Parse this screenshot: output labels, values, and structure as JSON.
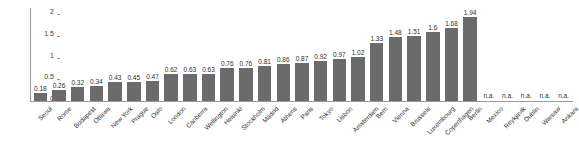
{
  "chart_data": {
    "type": "bar",
    "title": "",
    "subtitle": "",
    "xlabel": "",
    "ylabel": "",
    "ylim": [
      0,
      2.15
    ],
    "yticks": [
      "0",
      "0.5",
      "1",
      "1.5",
      "2"
    ],
    "ytick_values": [
      0,
      0.5,
      1,
      1.5,
      2
    ],
    "grid": false,
    "legend": false,
    "legend_position": "none",
    "bar_color": "#6b6b6b",
    "axis_color": "#9a9a9a",
    "text_color": "#2e2e2e",
    "background": "#ffffff",
    "na_label": "n.a.",
    "categories": [
      "Seoul",
      "Rome",
      "Budapest",
      "Ottawa",
      "New York",
      "Prague",
      "Oslo",
      "London",
      "Canberra",
      "Wellington",
      "Helsinki",
      "Stockholm",
      "Madrid",
      "Athens",
      "Paris",
      "Tokyo",
      "Lisbon",
      "Amsterdam",
      "Bern",
      "Vienna",
      "Brussels",
      "Luxembourg",
      "Copenhagen",
      "Berlin",
      "Mexico",
      "Reykjavik",
      "Dublin",
      "Warsaw",
      "Ankara"
    ],
    "values": [
      0.18,
      0.26,
      0.32,
      0.34,
      0.43,
      0.45,
      0.47,
      0.62,
      0.63,
      0.63,
      0.76,
      0.76,
      0.81,
      0.86,
      0.87,
      0.92,
      0.97,
      1.02,
      1.33,
      1.48,
      1.51,
      1.6,
      1.68,
      1.94,
      null,
      null,
      null,
      null,
      null
    ],
    "labels": [
      "0.18",
      "0.26",
      "0.32",
      "0.34",
      "0.43",
      "0.45",
      "0.47",
      "0.62",
      "0.63",
      "0.63",
      "0.76",
      "0.76",
      "0.81",
      "0.86",
      "0.87",
      "0.92",
      "0.97",
      "1.02",
      "1.33",
      "1.48",
      "1.51",
      "1.6",
      "1.68",
      "1.94",
      "n.a.",
      "n.a.",
      "n.a.",
      "n.a.",
      "n.a."
    ]
  }
}
